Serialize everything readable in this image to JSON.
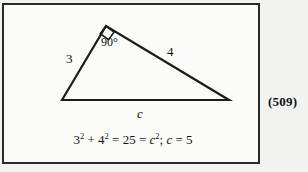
{
  "figure": {
    "caption_number": "(509)",
    "triangle": {
      "vertices": {
        "left": [
          60,
          98
        ],
        "apex": [
          104,
          24
        ],
        "right": [
          227,
          98
        ]
      },
      "right_angle_marker_at": "apex",
      "labels": {
        "leg_a": "3",
        "leg_b": "4",
        "angle": "90°",
        "hypotenuse": "c"
      }
    },
    "equation": {
      "base_1": "3",
      "exp_1": "2",
      "op_1": " + ",
      "base_2": "4",
      "exp_2": "2",
      "eq_1": " = ",
      "value": "25",
      "eq_2": " = ",
      "var_c_1": "c",
      "exp_3": "2",
      "separator": "; ",
      "var_c_2": "c",
      "eq_3": " = ",
      "result": "5",
      "plain_text": "3² + 4² = 25 = c²; c = 5"
    }
  },
  "colors": {
    "page_background": "#f2f2f0",
    "figure_background": "#fbfbfa",
    "border": "#2a2a2a",
    "ink": "#111111"
  }
}
